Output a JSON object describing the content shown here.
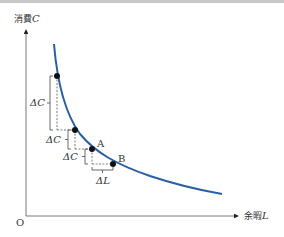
{
  "diagram": {
    "y_axis": {
      "label_text": "消費",
      "label_var": "C"
    },
    "x_axis": {
      "label_text": "余暇",
      "label_var": "L"
    },
    "origin_label": "O",
    "curve_color": "#2a5fa8",
    "points": [
      {
        "name": "P1",
        "label": ""
      },
      {
        "name": "P2",
        "label": ""
      },
      {
        "name": "A",
        "label": "A"
      },
      {
        "name": "B",
        "label": "B"
      }
    ],
    "delta_c_labels": [
      "ΔC",
      "ΔC",
      "ΔC"
    ],
    "delta_l_label": "ΔL"
  }
}
